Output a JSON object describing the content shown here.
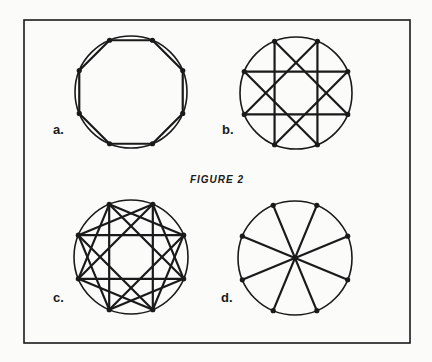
{
  "figure": {
    "title": "FIGURE 2",
    "frame": {
      "x": 24,
      "y": 20,
      "width": 386,
      "height": 323
    },
    "stroke_color": "#1a1a1a",
    "background": "#fbfbf9",
    "panels": [
      {
        "id": "a",
        "label": "a.",
        "center": [
          131,
          92
        ],
        "radius": 56,
        "points": 8,
        "connect": "adjacent",
        "description": "Octagon inscribed in circle (each point joined to its neighbor)"
      },
      {
        "id": "b",
        "label": "b.",
        "center": [
          296,
          93
        ],
        "radius": 56,
        "points": 8,
        "connect": "skip-1",
        "description": "Eight-point star {8/3}-style: each point joined to points 3 away"
      },
      {
        "id": "c",
        "label": "c.",
        "center": [
          131,
          257
        ],
        "radius": 57,
        "points": 8,
        "connect": "skip-2",
        "description": "Two interlocking squares plus chords forming an eight-point star {8/3}"
      },
      {
        "id": "d",
        "label": "d.",
        "center": [
          295,
          258
        ],
        "radius": 57,
        "points": 8,
        "connect": "diameters",
        "description": "Four diameters joining opposite points through the center"
      }
    ]
  }
}
